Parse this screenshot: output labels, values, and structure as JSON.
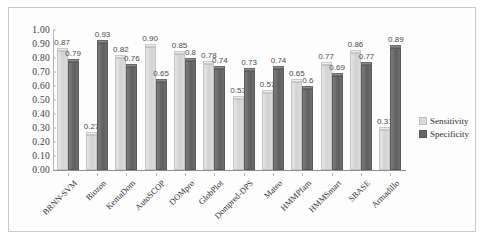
{
  "chart_data": {
    "type": "bar",
    "title": "",
    "subtitle": "",
    "xlabel": "",
    "ylabel": "",
    "ylim": [
      0.0,
      1.0
    ],
    "ytick_labels": [
      "1.00",
      "0.90",
      "0.80",
      "0.70",
      "0.60",
      "0.50",
      "0.40",
      "0.30",
      "0.20",
      "0.10",
      "0.00"
    ],
    "ytick_values": [
      1.0,
      0.9,
      0.8,
      0.7,
      0.6,
      0.5,
      0.4,
      0.3,
      0.2,
      0.1,
      0.0
    ],
    "grid": false,
    "legend_position": "right",
    "categories": [
      "BRNN-SVM",
      "Biozon",
      "KemaDom",
      "AutoSCOP",
      "DOMpro",
      "GlobPlot",
      "Dompred-DPS",
      "Mateo",
      "HMMPfam",
      "HMMSmart",
      "SBASE",
      "Armadillo"
    ],
    "series": [
      {
        "name": "Sensitivity",
        "color": "#dcdcdc",
        "values": [
          0.87,
          0.27,
          0.82,
          0.9,
          0.85,
          0.78,
          0.53,
          0.57,
          0.65,
          0.77,
          0.86,
          0.31
        ],
        "labels": [
          "0.87",
          "0.27",
          "0.82",
          "0.90",
          "0.85",
          "0.78",
          "0.53",
          "0.57",
          "0.65",
          "0.77",
          "0.86",
          "0.31"
        ]
      },
      {
        "name": "Specificity",
        "color": "#666666",
        "values": [
          0.79,
          0.93,
          0.76,
          0.65,
          0.8,
          0.74,
          0.73,
          0.74,
          0.6,
          0.69,
          0.77,
          0.89
        ],
        "labels": [
          "0.79",
          "0.93",
          "0.76",
          "0.65",
          "0.8",
          "0.74",
          "0.73",
          "0.74",
          "0.6",
          "0.69",
          "0.77",
          "0.89"
        ]
      }
    ]
  },
  "legend": {
    "items": [
      {
        "label": "Sensitivity",
        "swatch": "sens"
      },
      {
        "label": "Specificity",
        "swatch": "spec"
      }
    ]
  }
}
